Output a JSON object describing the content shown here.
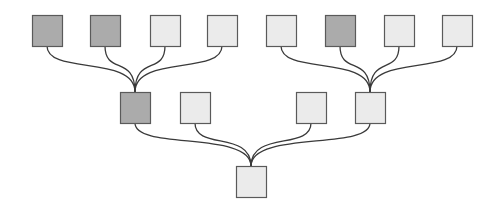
{
  "diagram": {
    "type": "tree",
    "colors": {
      "dark_fill": "#ababab",
      "light_fill": "#ebebeb",
      "border": "#5a5a5a",
      "edge": "#3a3a3a",
      "background": "#ffffff"
    },
    "node_size": {
      "w": 30,
      "h": 31
    },
    "nodes": [
      {
        "id": "t1",
        "level": 0,
        "x": 32,
        "y": 15,
        "shade": "dark"
      },
      {
        "id": "t2",
        "level": 0,
        "x": 90,
        "y": 15,
        "shade": "dark"
      },
      {
        "id": "t3",
        "level": 0,
        "x": 150,
        "y": 15,
        "shade": "light"
      },
      {
        "id": "t4",
        "level": 0,
        "x": 207,
        "y": 15,
        "shade": "light"
      },
      {
        "id": "t5",
        "level": 0,
        "x": 266,
        "y": 15,
        "shade": "light"
      },
      {
        "id": "t6",
        "level": 0,
        "x": 325,
        "y": 15,
        "shade": "dark"
      },
      {
        "id": "t7",
        "level": 0,
        "x": 384,
        "y": 15,
        "shade": "light"
      },
      {
        "id": "t8",
        "level": 0,
        "x": 442,
        "y": 15,
        "shade": "light"
      },
      {
        "id": "m1",
        "level": 1,
        "x": 120,
        "y": 92,
        "shade": "dark"
      },
      {
        "id": "m2",
        "level": 1,
        "x": 180,
        "y": 92,
        "shade": "light"
      },
      {
        "id": "m3",
        "level": 1,
        "x": 296,
        "y": 92,
        "shade": "light"
      },
      {
        "id": "m4",
        "level": 1,
        "x": 355,
        "y": 92,
        "shade": "light"
      },
      {
        "id": "b1",
        "level": 2,
        "x": 236,
        "y": 166,
        "shade": "light"
      }
    ],
    "edges": [
      {
        "from": "t1",
        "to": "m1"
      },
      {
        "from": "t2",
        "to": "m1"
      },
      {
        "from": "t3",
        "to": "m1"
      },
      {
        "from": "t4",
        "to": "m1"
      },
      {
        "from": "t5",
        "to": "m4"
      },
      {
        "from": "t6",
        "to": "m4"
      },
      {
        "from": "t7",
        "to": "m4"
      },
      {
        "from": "t8",
        "to": "m4"
      },
      {
        "from": "m1",
        "to": "b1"
      },
      {
        "from": "m2",
        "to": "b1"
      },
      {
        "from": "m3",
        "to": "b1"
      },
      {
        "from": "m4",
        "to": "b1"
      }
    ]
  }
}
